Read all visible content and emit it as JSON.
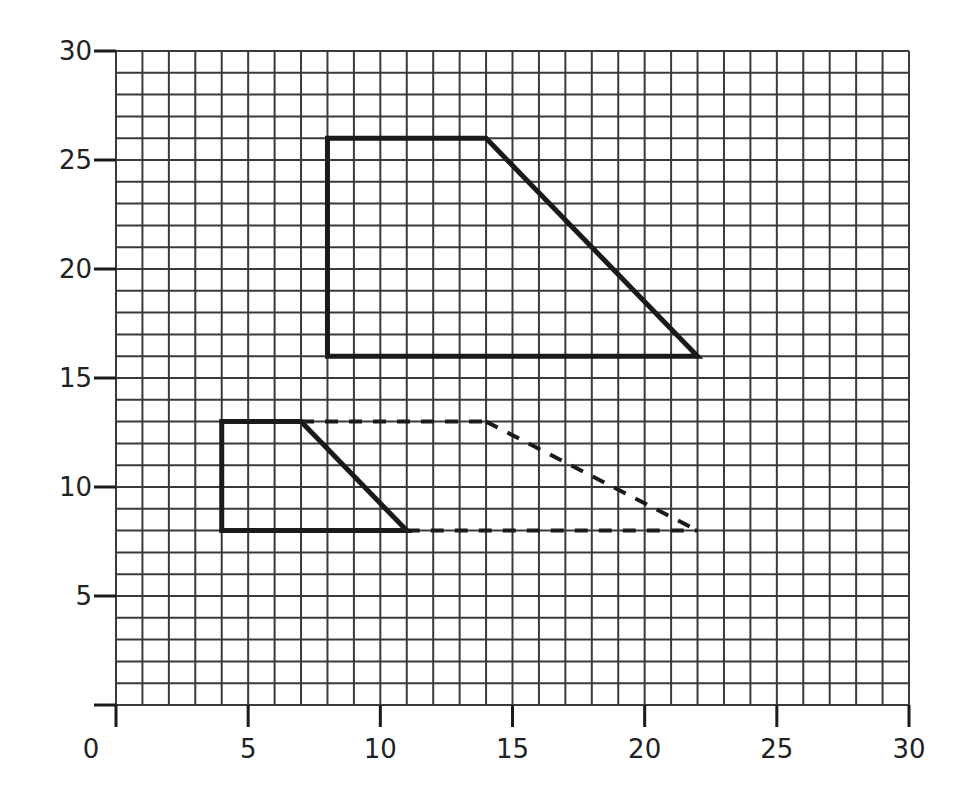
{
  "chart_data": {
    "type": "scatter",
    "subtype": "coordinate-grid-shapes",
    "title": "",
    "xlabel": "",
    "ylabel": "",
    "xlim": [
      0,
      30
    ],
    "ylim": [
      0,
      30
    ],
    "grid": true,
    "grid_step": 1,
    "legend": null,
    "x_ticks": [
      0,
      5,
      10,
      15,
      20,
      25,
      30
    ],
    "y_ticks": [
      5,
      10,
      15,
      20,
      25,
      30
    ],
    "x_tick_labels": [
      "0",
      "5",
      "10",
      "15",
      "20",
      "25",
      "30"
    ],
    "y_tick_labels": [
      "5",
      "10",
      "15",
      "20",
      "25",
      "30"
    ],
    "shapes": [
      {
        "name": "large-trapezoid",
        "style": "solid",
        "closed": true,
        "points": [
          [
            8,
            16
          ],
          [
            8,
            26
          ],
          [
            14,
            26
          ],
          [
            22,
            16
          ]
        ]
      },
      {
        "name": "small-trapezoid",
        "style": "solid",
        "closed": true,
        "points": [
          [
            4,
            8
          ],
          [
            4,
            13
          ],
          [
            7,
            13
          ],
          [
            11,
            8
          ]
        ]
      },
      {
        "name": "dashed-extension",
        "style": "dashed",
        "closed": false,
        "segments": [
          [
            [
              7,
              13
            ],
            [
              14,
              13
            ]
          ],
          [
            [
              14,
              13
            ],
            [
              22,
              8
            ]
          ],
          [
            [
              11,
              8
            ],
            [
              22,
              8
            ]
          ]
        ]
      }
    ]
  },
  "colors": {
    "grid": "#3a3a3a",
    "shape": "#1a1a1a",
    "text": "#222222",
    "background": "#ffffff"
  },
  "axis": {
    "x_labels": [
      "0",
      "5",
      "10",
      "15",
      "20",
      "25",
      "30"
    ],
    "y_labels": [
      "5",
      "10",
      "15",
      "20",
      "25",
      "30"
    ]
  }
}
